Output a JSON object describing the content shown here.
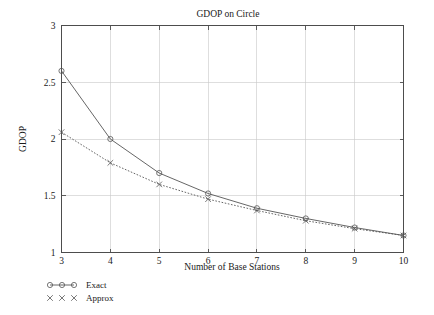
{
  "chart_data": {
    "type": "line",
    "title": "GDOP on Circle",
    "xlabel": "Number of Base Stations",
    "ylabel": "GDOP",
    "x": [
      3,
      4,
      5,
      6,
      7,
      8,
      9,
      10
    ],
    "xlim": [
      3,
      10
    ],
    "ylim": [
      1,
      3
    ],
    "xticks": [
      "3",
      "4",
      "5",
      "6",
      "7",
      "8",
      "9",
      "10"
    ],
    "yticks": [
      "1",
      "1.5",
      "2",
      "2.5",
      "3"
    ],
    "grid": true,
    "legend_position": "below-left",
    "series": [
      {
        "name": "Exact",
        "marker": "circle",
        "linestyle": "solid",
        "color": "#555555",
        "values": [
          2.6,
          2.0,
          1.7,
          1.52,
          1.39,
          1.3,
          1.22,
          1.15
        ]
      },
      {
        "name": "Approx",
        "marker": "cross",
        "linestyle": "dotted",
        "color": "#555555",
        "values": [
          2.06,
          1.79,
          1.6,
          1.47,
          1.37,
          1.28,
          1.21,
          1.15
        ]
      }
    ]
  },
  "legend": {
    "entries": [
      {
        "label": "Exact",
        "marker": "circle-marker"
      },
      {
        "label": "Approx",
        "marker": "cross-marker"
      }
    ]
  },
  "colors": {
    "grid": "#c8c8c8",
    "frame": "#4d4d4d",
    "line": "#555555",
    "text": "#1a1a1a",
    "background": "#ffffff"
  }
}
